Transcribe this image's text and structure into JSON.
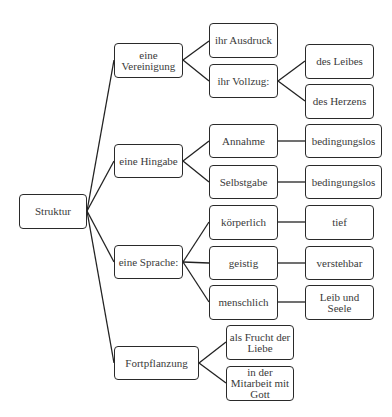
{
  "diagram": {
    "type": "tree",
    "root": "Struktur",
    "nodes": {
      "root": "Struktur",
      "vereinigung": "eine Vereinigung",
      "hingabe": "eine Hingabe",
      "sprache": "eine Sprache:",
      "fortpflanzung": "Fortpflanzung",
      "ausdruck": "ihr Ausdruck",
      "vollzug": "ihr Vollzug:",
      "leibes": "des Leibes",
      "herzens": "des Herzens",
      "annahme": "Annahme",
      "selbstgabe": "Selbstgabe",
      "bedingungslos1": "bedingungslos",
      "bedingungslos2": "bedingungslos",
      "koerperlich": "körperlich",
      "geistig": "geistig",
      "menschlich": "menschlich",
      "tief": "tief",
      "verstehbar": "verstehbar",
      "leibseele": "Leib und Seele",
      "frucht": "als Frucht der Liebe",
      "mitarbeit": "in der Mitarbeit mit Gott"
    },
    "edges": [
      [
        "Struktur",
        "eine Vereinigung"
      ],
      [
        "Struktur",
        "eine Hingabe"
      ],
      [
        "Struktur",
        "eine Sprache:"
      ],
      [
        "Struktur",
        "Fortpflanzung"
      ],
      [
        "eine Vereinigung",
        "ihr Ausdruck"
      ],
      [
        "eine Vereinigung",
        "ihr Vollzug:"
      ],
      [
        "ihr Vollzug:",
        "des Leibes"
      ],
      [
        "ihr Vollzug:",
        "des Herzens"
      ],
      [
        "eine Hingabe",
        "Annahme"
      ],
      [
        "eine Hingabe",
        "Selbstgabe"
      ],
      [
        "Annahme",
        "bedingungslos"
      ],
      [
        "Selbstgabe",
        "bedingungslos"
      ],
      [
        "eine Sprache:",
        "körperlich"
      ],
      [
        "eine Sprache:",
        "geistig"
      ],
      [
        "eine Sprache:",
        "menschlich"
      ],
      [
        "körperlich",
        "tief"
      ],
      [
        "geistig",
        "verstehbar"
      ],
      [
        "menschlich",
        "Leib und Seele"
      ],
      [
        "Fortpflanzung",
        "als Frucht der Liebe"
      ],
      [
        "Fortpflanzung",
        "in der Mitarbeit mit Gott"
      ]
    ]
  }
}
